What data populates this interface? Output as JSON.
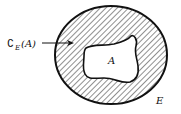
{
  "diagram": {
    "labels": {
      "complement_symbol": "∁",
      "complement_subscript": "E",
      "complement_arg": "(A)",
      "inner_set": "A",
      "outer_set": "E"
    },
    "colors": {
      "stroke": "#111111",
      "hatch": "#222222",
      "background": "#ffffff"
    },
    "regions": [
      {
        "name": "E",
        "shape": "ellipse",
        "fill": "hatched"
      },
      {
        "name": "A",
        "shape": "irregular blob",
        "fill": "white"
      }
    ]
  }
}
